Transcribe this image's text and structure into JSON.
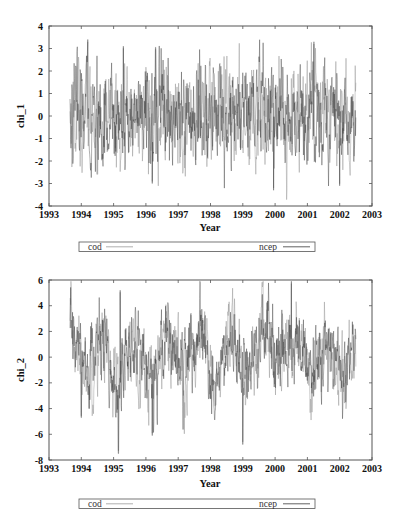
{
  "chart_data": [
    {
      "type": "line",
      "title": "",
      "xlabel": "Year",
      "ylabel": "chi_1",
      "xlim": [
        1993,
        2003
      ],
      "ylim": [
        -4,
        4
      ],
      "xticks": [
        "1993",
        "1994",
        "1995",
        "1996",
        "1997",
        "1998",
        "1999",
        "2000",
        "2001",
        "2002",
        "2003"
      ],
      "yticks": [
        "4",
        "3",
        "2",
        "1",
        "0",
        "-1",
        "-2",
        "-3",
        "-4"
      ],
      "grid": false,
      "legend_position": "below",
      "data_range_x": [
        1993.65,
        2002.5
      ],
      "series": [
        {
          "name": "cod",
          "color": "#9a9a9a",
          "approx_mean": 0.0,
          "approx_min": -3.3,
          "approx_max": 3.4
        },
        {
          "name": "ncep",
          "color": "#3a3a3a",
          "approx_mean": 0.0,
          "approx_min": -3.2,
          "approx_max": 3.3
        }
      ],
      "notable_points": [
        {
          "x": 1994.2,
          "y": 3.4
        },
        {
          "x": 1995.3,
          "y": 3.1
        },
        {
          "x": 1996.3,
          "y": 3.05
        },
        {
          "x": 2001.2,
          "y": 3.3
        },
        {
          "x": 1999.95,
          "y": -3.3
        },
        {
          "x": 2002.0,
          "y": -3.1
        },
        {
          "x": 1996.2,
          "y": -3.0
        }
      ]
    },
    {
      "type": "line",
      "title": "",
      "xlabel": "Year",
      "ylabel": "chi_2",
      "xlim": [
        1993,
        2003
      ],
      "ylim": [
        -8,
        6
      ],
      "xticks": [
        "1993",
        "1994",
        "1995",
        "1996",
        "1997",
        "1998",
        "1999",
        "2000",
        "2001",
        "2002",
        "2003"
      ],
      "yticks": [
        "6",
        "4",
        "2",
        "0",
        "-2",
        "-4",
        "-6",
        "-8"
      ],
      "grid": false,
      "legend_position": "below",
      "data_range_x": [
        1993.65,
        2002.5
      ],
      "series": [
        {
          "name": "cod",
          "color": "#9a9a9a",
          "approx_mean": 0.0,
          "approx_min": -7.5,
          "approx_max": 5.2
        },
        {
          "name": "ncep",
          "color": "#3a3a3a",
          "approx_mean": 0.0,
          "approx_min": -7.3,
          "approx_max": 5.9
        }
      ],
      "notable_points": [
        {
          "x": 1995.2,
          "y": 5.2
        },
        {
          "x": 2000.5,
          "y": 5.9
        },
        {
          "x": 1995.15,
          "y": -7.5
        },
        {
          "x": 1999.0,
          "y": -6.8
        },
        {
          "x": 1996.2,
          "y": -6.1
        },
        {
          "x": 1994.0,
          "y": -4.7
        }
      ],
      "annual_cycle": true
    }
  ],
  "plots": [
    {
      "ylabel": "chi_1",
      "xlabel": "Year",
      "xticks": [
        "1993",
        "1994",
        "1995",
        "1996",
        "1997",
        "1998",
        "1999",
        "2000",
        "2001",
        "2002",
        "2003"
      ],
      "yticks": [
        "4",
        "3",
        "2",
        "1",
        "0",
        "-1",
        "-2",
        "-3",
        "-4"
      ],
      "legend": [
        {
          "label": "cod"
        },
        {
          "label": "ncep"
        }
      ]
    },
    {
      "ylabel": "chi_2",
      "xlabel": "Year",
      "xticks": [
        "1993",
        "1994",
        "1995",
        "1996",
        "1997",
        "1998",
        "1999",
        "2000",
        "2001",
        "2002",
        "2003"
      ],
      "yticks": [
        "6",
        "4",
        "2",
        "0",
        "-2",
        "-4",
        "-6",
        "-8"
      ],
      "legend": [
        {
          "label": "cod"
        },
        {
          "label": "ncep"
        }
      ]
    }
  ],
  "colors": {
    "cod": "#9a9a9a",
    "ncep": "#3a3a3a",
    "axis": "#555555"
  }
}
